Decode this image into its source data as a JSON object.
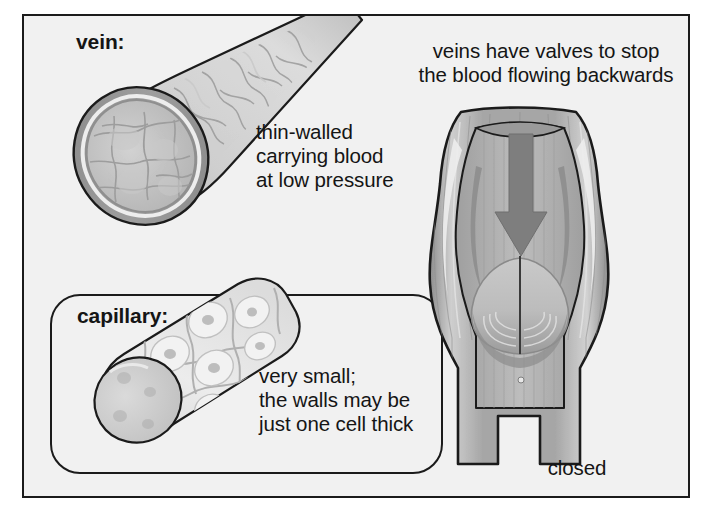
{
  "figure": {
    "background_color": "#f1f1f1",
    "frame_color": "#1b1b1b",
    "ink_color": "#151515"
  },
  "labels": {
    "vein": "vein:",
    "capillary": "capillary:",
    "closed": "closed"
  },
  "captions": {
    "vein_description": "thin-walled\ncarrying blood\nat low pressure",
    "valve_description": "veins have valves to stop\nthe blood flowing backwards",
    "capillary_description": "very small;\nthe walls may be\njust one cell thick"
  },
  "illustrations": {
    "vein_tube": {
      "name": "vein-tube-illustration",
      "description": "cut-away cylindrical vein running from lower-left to upper-right with a thick textured wall and open lumen showing cell pattern",
      "outline_color": "#1b1b1b",
      "wall_outer_color": "#8d8d8d",
      "wall_inner_color": "#a9a9a9",
      "lumen_color": "#c2c2c2",
      "surface_color": "#cdcdcd"
    },
    "capillary_tube": {
      "name": "capillary-tube-illustration",
      "description": "short pale cylinder made of a single layer of large flat cells, each with a nucleus, cut open at the lower-left end",
      "outline_color": "#1b1b1b",
      "cell_color": "#e6e6e6",
      "cell_edge_color": "#b4b4b4",
      "end_color": "#cfcfcf"
    },
    "valve": {
      "name": "vein-valve-illustration",
      "description": "cut-away bulging section of vein with two pocket valve cusps pressed together in the closed position; a grey arrow points downward from the top showing blood pushing back against the valve",
      "outline_color": "#1b1b1b",
      "wall_color": "#9a9a9a",
      "lumen_color": "#b6b6b6",
      "cusp_color": "#c4c4c4",
      "highlight_color": "#e8e8e8",
      "arrow_color": "#7e7e7e",
      "arrow_direction": "down",
      "state": "closed"
    }
  }
}
